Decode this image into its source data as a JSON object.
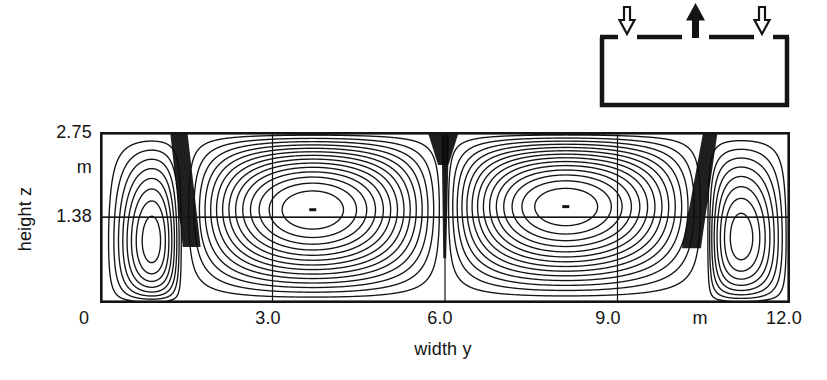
{
  "figure": {
    "kind": "scanned scientific figure"
  },
  "axes": {
    "xlabel": "width y",
    "ylabel": "height z",
    "x_ticks": [
      {
        "label": "0",
        "y_m": 0
      },
      {
        "label": "3.0",
        "y_m": 3.0
      },
      {
        "label": "6.0",
        "y_m": 6.0
      },
      {
        "label": "9.0",
        "y_m": 9.0
      },
      {
        "label": "m",
        "y_m": null
      },
      {
        "label": "12.0",
        "y_m": 12.0
      }
    ],
    "y_ticks": [
      {
        "label": "2.75",
        "z_m": 2.75
      },
      {
        "label": "m",
        "z_m": null
      },
      {
        "label": "1.38",
        "z_m": 1.38
      }
    ]
  },
  "chart_data": {
    "type": "contour",
    "title": "",
    "xlabel": "width y",
    "ylabel": "height z",
    "y_range_m": [
      0,
      12.0
    ],
    "z_range_m": [
      0,
      2.75
    ],
    "x_tick_labels": [
      "0",
      "3.0",
      "6.0",
      "9.0",
      "m",
      "12.0"
    ],
    "z_tick_labels": [
      "2.75",
      "m",
      "1.38"
    ],
    "grid_lines_m": {
      "vertical": [
        3.0,
        6.0,
        9.0
      ],
      "horizontal": [
        1.38
      ]
    },
    "contour_levels": 15,
    "recirculation_cells": [
      {
        "y_span_m": [
          0,
          1.45
        ],
        "vortex_center_m": [
          0.9,
          1.0
        ],
        "relative_strength": 0.58,
        "sense": "cw"
      },
      {
        "y_span_m": [
          1.45,
          6.0
        ],
        "vortex_center_m": [
          3.7,
          1.5
        ],
        "relative_strength": 1.0,
        "sense": "ccw"
      },
      {
        "y_span_m": [
          6.0,
          10.55
        ],
        "vortex_center_m": [
          8.1,
          1.55
        ],
        "relative_strength": 1.0,
        "sense": "cw"
      },
      {
        "y_span_m": [
          10.55,
          12.0
        ],
        "vortex_center_m": [
          11.15,
          1.05
        ],
        "relative_strength": 0.58,
        "sense": "ccw"
      }
    ],
    "vortex_center_marks_m": [
      [
        3.7,
        1.5
      ],
      [
        8.1,
        1.55
      ]
    ],
    "jets": [
      {
        "kind": "supply-inlet",
        "flow": "down",
        "polygon_m": [
          [
            1.22,
            2.75
          ],
          [
            1.52,
            2.75
          ],
          [
            1.75,
            0.9
          ],
          [
            1.44,
            0.9
          ]
        ]
      },
      {
        "kind": "exhaust-plume-head",
        "flow": "up",
        "polygon_m": [
          [
            5.7,
            2.75
          ],
          [
            6.24,
            2.75
          ],
          [
            6.06,
            2.22
          ],
          [
            5.88,
            2.22
          ]
        ]
      },
      {
        "kind": "exhaust-plume-core",
        "flow": "up",
        "polygon_m": [
          [
            5.94,
            2.75
          ],
          [
            6.07,
            2.75
          ],
          [
            6.02,
            0.72
          ],
          [
            5.97,
            0.72
          ]
        ]
      },
      {
        "kind": "supply-inlet",
        "flow": "down",
        "polygon_m": [
          [
            10.49,
            2.75
          ],
          [
            10.74,
            2.75
          ],
          [
            10.45,
            0.88
          ],
          [
            10.12,
            0.88
          ]
        ]
      }
    ]
  },
  "inset": {
    "name": "room ventilation schematic",
    "openings": [
      {
        "kind": "supply inlet",
        "arrow": "hollow-down"
      },
      {
        "kind": "exhaust outlet",
        "arrow": "filled-up"
      },
      {
        "kind": "supply inlet",
        "arrow": "hollow-down"
      }
    ]
  },
  "colors": {
    "ink": "#141414",
    "paper": "#ffffff"
  }
}
